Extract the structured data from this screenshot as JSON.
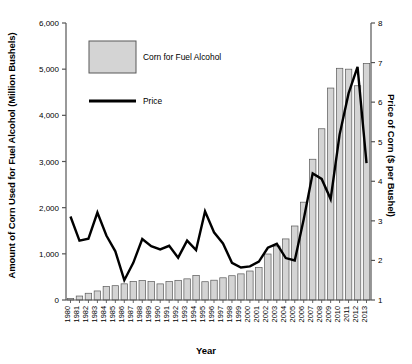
{
  "chart_data": {
    "type": "bar",
    "title": "",
    "xlabel": "Year",
    "ylabel": "Amount of Corn Used for Fuel Alcohol (Million Bushels)",
    "ylabel_right": "Price of Corn ($ per Bushel)",
    "grid": false,
    "legend_position": "top-left",
    "ylim": [
      0,
      6000
    ],
    "ylim_right": [
      1,
      8
    ],
    "yticks": [
      "0",
      "1,000",
      "2,000",
      "3,000",
      "4,000",
      "5,000",
      "6,000"
    ],
    "ytick_values": [
      0,
      1000,
      2000,
      3000,
      4000,
      5000,
      6000
    ],
    "yticks_right": [
      "1",
      "2",
      "3",
      "4",
      "5",
      "6",
      "7",
      "8"
    ],
    "ytick_values_right": [
      1,
      2,
      3,
      4,
      5,
      6,
      7,
      8
    ],
    "categories": [
      "1980",
      "1981",
      "1982",
      "1983",
      "1984",
      "1985",
      "1986",
      "1987",
      "1988",
      "1989",
      "1990",
      "1991",
      "1992",
      "1993",
      "1994",
      "1995",
      "1996",
      "1997",
      "1998",
      "1999",
      "2000",
      "2001",
      "2002",
      "2003",
      "2004",
      "2005",
      "2006",
      "2007",
      "2008",
      "2009",
      "2010",
      "2011",
      "2012",
      "2013"
    ],
    "series": [
      {
        "name": "Corn for Fuel Alcohol",
        "axis": "left",
        "type": "bar",
        "unit": "Million Bushels",
        "values": [
          35,
          86,
          146,
          196,
          292,
          310,
          350,
          404,
          423,
          398,
          349,
          398,
          426,
          458,
          533,
          396,
          429,
          481,
          526,
          566,
          628,
          706,
          996,
          1168,
          1323,
          1603,
          2119,
          3049,
          3709,
          4591,
          5019,
          5000,
          4641,
          5124
        ]
      },
      {
        "name": "Price",
        "axis": "right",
        "type": "line",
        "unit": "$ per Bushel",
        "values": [
          3.11,
          2.5,
          2.55,
          3.21,
          2.63,
          2.23,
          1.5,
          1.94,
          2.54,
          2.36,
          2.28,
          2.37,
          2.07,
          2.5,
          2.26,
          3.24,
          2.71,
          2.43,
          1.94,
          1.82,
          1.85,
          1.97,
          2.32,
          2.42,
          2.06,
          2.0,
          3.04,
          4.2,
          4.06,
          3.55,
          5.18,
          6.22,
          6.89,
          4.46
        ]
      }
    ],
    "annotations": []
  },
  "legend": {
    "bar_label": "Corn for Fuel Alcohol",
    "line_label": "Price"
  },
  "colors": {
    "bar_fill": "#d4d4d4",
    "bar_stroke": "#595959",
    "line": "#000000",
    "axis": "#555555",
    "text": "#000000"
  }
}
